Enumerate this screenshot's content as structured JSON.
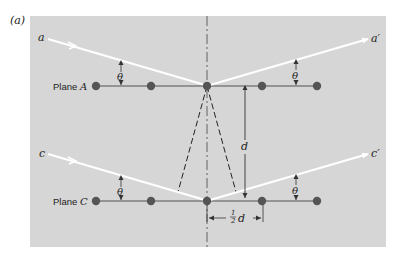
{
  "figure": {
    "label": "(a)",
    "colors": {
      "panel": "#d6d6d6",
      "ray": "#ffffff",
      "atom": "#555555",
      "line": "#333333"
    }
  },
  "rays": {
    "incident_top": "a",
    "reflected_top": "a′",
    "incident_bottom": "c",
    "reflected_bottom": "c′"
  },
  "planes": [
    {
      "prefix": "Plane ",
      "letter": "A"
    },
    {
      "prefix": "Plane ",
      "letter": "C"
    }
  ],
  "angles": {
    "theta": "θ"
  },
  "dimensions": {
    "spacing": "d",
    "half_num": "1",
    "half_den": "2",
    "half_var": "d"
  }
}
